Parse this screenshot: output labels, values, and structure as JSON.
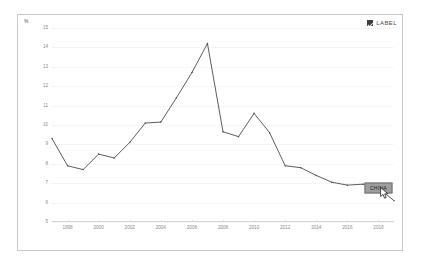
{
  "card": {
    "unit_label": "%",
    "border_color": "#c9c9c9",
    "background_color": "#ffffff"
  },
  "legend": {
    "checkbox_icon": "checked-checkbox-icon",
    "checkbox_checked": true,
    "label": "LABEL",
    "color": "#3f3f3f"
  },
  "tooltip": {
    "label": "CHINA",
    "background_color": "#9e9e9e",
    "border_color": "#6f6f6f"
  },
  "cursor": {
    "icon": "mouse-pointer-icon"
  },
  "chart_data": {
    "type": "line",
    "title": "",
    "subtitle": "",
    "xlabel": "",
    "ylabel": "%",
    "ylim": [
      5,
      15
    ],
    "xlim": [
      1997,
      2019
    ],
    "grid": true,
    "legend_position": "top-right",
    "series_color": "#4a4a4a",
    "ytick_labels": [
      "15",
      "14",
      "13",
      "12",
      "11",
      "10",
      "9",
      "8",
      "7",
      "6",
      "5"
    ],
    "ytick_values": [
      15,
      14,
      13,
      12,
      11,
      10,
      9,
      8,
      7,
      6,
      5
    ],
    "xtick_labels": [
      "1998",
      "2000",
      "2002",
      "2004",
      "2006",
      "2008",
      "2010",
      "2012",
      "2014",
      "2016",
      "2018"
    ],
    "xtick_values": [
      1998,
      2000,
      2002,
      2004,
      2006,
      2008,
      2010,
      2012,
      2014,
      2016,
      2018
    ],
    "x": [
      1997,
      1998,
      1999,
      2000,
      2001,
      2002,
      2003,
      2004,
      2005,
      2006,
      2007,
      2008,
      2009,
      2010,
      2011,
      2012,
      2013,
      2014,
      2015,
      2016,
      2017,
      2018,
      2019
    ],
    "series": [
      {
        "name": "CHINA",
        "values": [
          9.3,
          7.9,
          7.7,
          8.5,
          8.3,
          9.1,
          10.1,
          10.15,
          11.4,
          12.7,
          14.2,
          9.65,
          9.4,
          10.6,
          9.6,
          7.9,
          7.8,
          7.4,
          7.05,
          6.9,
          6.95,
          6.75,
          6.1
        ]
      }
    ]
  }
}
